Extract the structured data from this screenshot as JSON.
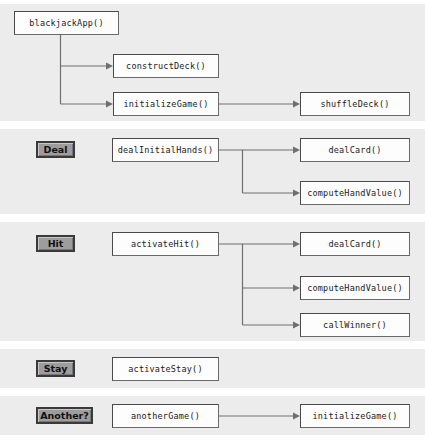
{
  "diagram": {
    "colors": {
      "panel_background": "#ececec",
      "page_background": "#ffffff",
      "node_fill": "#fdfdfd",
      "node_border": "#4a4a4a",
      "button_fill": "#9d9d9d",
      "button_border": "#3a3a3a",
      "connector": "#6f6f6f"
    },
    "panels": [
      {
        "name": "startup",
        "button": null,
        "nodes": [
          {
            "id": "blackjackApp",
            "label": "blackjackApp()"
          },
          {
            "id": "constructDeck",
            "label": "constructDeck()"
          },
          {
            "id": "initializeGame",
            "label": "initializeGame()"
          },
          {
            "id": "shuffleDeck",
            "label": "shuffleDeck()"
          }
        ]
      },
      {
        "name": "deal",
        "button": {
          "id": "deal-button",
          "label": "Deal"
        },
        "nodes": [
          {
            "id": "dealInitialHands",
            "label": "dealInitialHands()"
          },
          {
            "id": "dealCard1",
            "label": "dealCard()"
          },
          {
            "id": "computeHandValue1",
            "label": "computeHandValue()"
          }
        ]
      },
      {
        "name": "hit",
        "button": {
          "id": "hit-button",
          "label": "Hit"
        },
        "nodes": [
          {
            "id": "activateHit",
            "label": "activateHit()"
          },
          {
            "id": "dealCard2",
            "label": "dealCard()"
          },
          {
            "id": "computeHandValue2",
            "label": "computeHandValue()"
          },
          {
            "id": "callWinner",
            "label": "callWinner()"
          }
        ]
      },
      {
        "name": "stay",
        "button": {
          "id": "stay-button",
          "label": "Stay"
        },
        "nodes": [
          {
            "id": "activateStay",
            "label": "activateStay()"
          }
        ]
      },
      {
        "name": "another",
        "button": {
          "id": "another-button",
          "label": "Another?"
        },
        "nodes": [
          {
            "id": "anotherGame",
            "label": "anotherGame()"
          },
          {
            "id": "initializeGame2",
            "label": "initializeGame()"
          }
        ]
      }
    ]
  }
}
